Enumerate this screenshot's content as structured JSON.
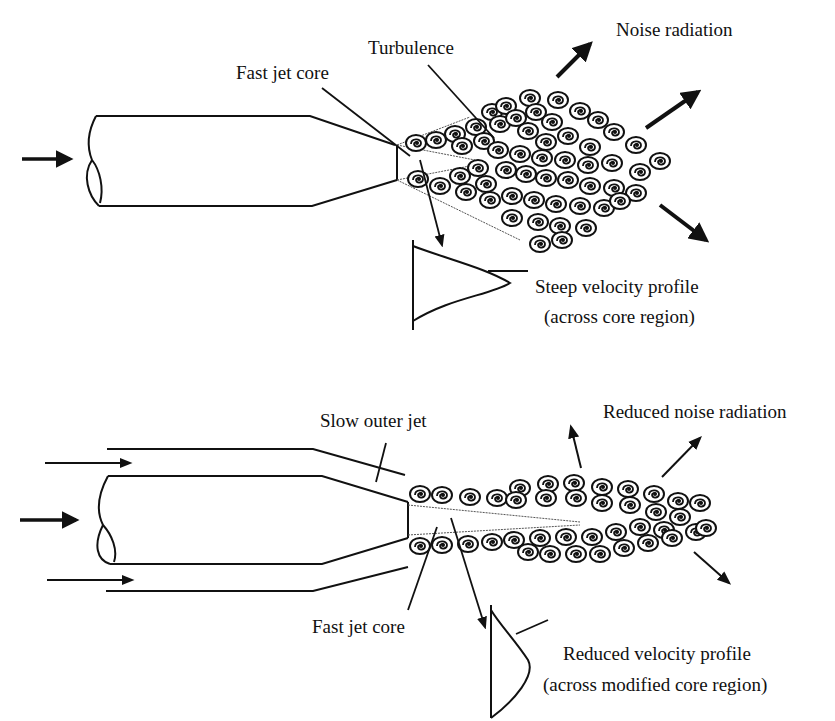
{
  "figure": {
    "title_cut_off": "Figure — mechanism of jet noise reduction with a bypass (slow outer) jet",
    "colors": {
      "ink": "#111111",
      "background": "#ffffff"
    }
  },
  "diagram_top": {
    "name": "Pure jet",
    "labels": {
      "turbulence": "Turbulence",
      "fast_jet_core": "Fast jet core",
      "noise_radiation": "Noise radiation",
      "velocity_profile_line1": "Steep velocity profile",
      "velocity_profile_line2": "(across core region)"
    },
    "icons": [
      "flow-arrow-icon",
      "noise-arrow-icon",
      "vortex-icon"
    ]
  },
  "diagram_bottom": {
    "name": "Bypass jet",
    "labels": {
      "slow_outer_jet": "Slow outer jet",
      "reduced_noise_radiation": "Reduced noise radiation",
      "fast_jet_core": "Fast jet core",
      "velocity_profile_line1": "Reduced velocity profile",
      "velocity_profile_line2": "(across modified core region)"
    },
    "icons": [
      "flow-arrow-icon",
      "noise-arrow-icon",
      "vortex-icon"
    ]
  }
}
